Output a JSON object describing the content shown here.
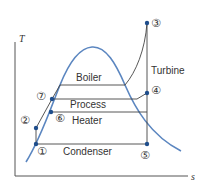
{
  "diagram": {
    "type": "T-s diagram",
    "axes": {
      "y_label": "T",
      "x_label": "s"
    },
    "process_labels": {
      "boiler": "Boiler",
      "turbine": "Turbine",
      "process": "Process",
      "heater": "Heater",
      "condenser": "Condenser"
    },
    "state_points": [
      {
        "id": "1",
        "glyph": "①"
      },
      {
        "id": "2",
        "glyph": "②"
      },
      {
        "id": "3",
        "glyph": "③"
      },
      {
        "id": "4",
        "glyph": "④"
      },
      {
        "id": "5",
        "glyph": "⑤"
      },
      {
        "id": "6",
        "glyph": "⑥"
      },
      {
        "id": "7",
        "glyph": "⑦"
      }
    ],
    "colors": {
      "dome": "#5b86c0",
      "points": "#1f4e8c",
      "lines": "#444444"
    }
  }
}
